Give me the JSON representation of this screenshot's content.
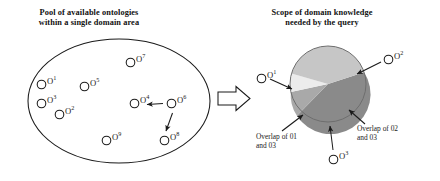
{
  "figure": {
    "width": 440,
    "height": 181,
    "background": "#ffffff",
    "stroke_color": "#1a1a1a"
  },
  "left_panel": {
    "caption": "Pool of available ontologies\nwithin a single domain area",
    "ellipse": {
      "cx": 119,
      "cy": 101,
      "rx": 91,
      "ry": 62
    },
    "nodes": [
      {
        "id": "o1",
        "label": "O",
        "sup": "1",
        "x": 38,
        "y": 81
      },
      {
        "id": "o3",
        "label": "O",
        "sup": "3",
        "x": 38,
        "y": 100
      },
      {
        "id": "o2",
        "label": "O",
        "sup": "2",
        "x": 56,
        "y": 111
      },
      {
        "id": "o5",
        "label": "O",
        "sup": "5",
        "x": 81,
        "y": 83
      },
      {
        "id": "o7",
        "label": "O",
        "sup": "7",
        "x": 127,
        "y": 59
      },
      {
        "id": "o4",
        "label": "O",
        "sup": "4",
        "x": 131,
        "y": 100
      },
      {
        "id": "o6",
        "label": "O",
        "sup": "6",
        "x": 168,
        "y": 100
      },
      {
        "id": "o9",
        "label": "O",
        "sup": "9",
        "x": 103,
        "y": 137
      },
      {
        "id": "o8",
        "label": "O",
        "sup": "8",
        "x": 161,
        "y": 137
      }
    ],
    "arrows": [
      {
        "id": "arrow-o6-to-o4",
        "from": "o6",
        "to": "o4"
      },
      {
        "id": "arrow-o6-to-o8",
        "from": "o6",
        "to": "o8"
      }
    ]
  },
  "transition": {
    "block_arrow_label": "transition-block-arrow"
  },
  "right_panel": {
    "caption": "Scope of domain knowledge\nneeded by the query",
    "pie": {
      "cx": 328,
      "cy": 84,
      "r": 38,
      "segments": [
        {
          "name": "O2 scope",
          "color": "#8a8a8a",
          "start_deg": -18,
          "end_deg": 145
        },
        {
          "name": "Overlap of 02 and 03",
          "color": "#a9a9a9",
          "start_deg": 145,
          "end_deg": 168
        },
        {
          "name": "Overlap of 01 and 03",
          "color": "#ececec",
          "start_deg": 168,
          "end_deg": 196
        },
        {
          "name": "O1 scope",
          "color": "#c6c6c6",
          "start_deg": 196,
          "end_deg": 342
        }
      ]
    },
    "nodes": [
      {
        "id": "o1r",
        "label": "O",
        "sup": "1",
        "x": 258,
        "y": 75
      },
      {
        "id": "o2r",
        "label": "O",
        "sup": "2",
        "x": 385,
        "y": 56
      },
      {
        "id": "o3r",
        "label": "O",
        "sup": "3",
        "x": 330,
        "y": 156
      }
    ],
    "annotations": [
      {
        "id": "overlap-left",
        "text": "Overlap of 01\nand 03"
      },
      {
        "id": "overlap-right",
        "text": "Overlap of 02\nand 03"
      }
    ],
    "pointers": [
      {
        "id": "pointer-o1-to-pie"
      },
      {
        "id": "pointer-o2-to-pie"
      },
      {
        "id": "pointer-o3-to-pie"
      },
      {
        "id": "pointer-overlap-left-to-pie"
      },
      {
        "id": "pointer-overlap-right-to-pie"
      }
    ]
  }
}
